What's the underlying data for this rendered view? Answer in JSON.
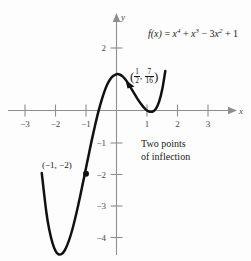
{
  "figure": {
    "type": "math-graph",
    "background": "#fdfdfd",
    "curve_color": "#111111",
    "axis_color": "#8e8e8e"
  },
  "labels": {
    "function_prefix": "f(x) = x",
    "function_exp1": "4",
    "function_mid1": " + x",
    "function_exp2": "3",
    "function_mid2": " − 3x",
    "function_exp3": "2",
    "function_tail": " + 1",
    "function_plain": "f(x) = x⁴ + x³ − 3x² + 1",
    "inflection_note_line1": "Two points",
    "inflection_note_line2": "of inflection",
    "minimum_point": "(−1, −2)",
    "inflection_point_plain": "(1/2, 7/16)",
    "inflection_num_x": "1",
    "inflection_den_x": "2",
    "inflection_num_y": "7",
    "inflection_den_y": "16",
    "x_axis_name": "x",
    "y_axis_name": "y"
  },
  "chart_data": {
    "type": "line",
    "xlabel": "x",
    "ylabel": "y",
    "xlim": [
      -3.6,
      3.6
    ],
    "ylim": [
      -4.7,
      2.6
    ],
    "grid": false,
    "legend": null,
    "x_ticks": [
      -3,
      -2,
      -1,
      1,
      2,
      3
    ],
    "x_tick_labels": [
      "−3",
      "−2",
      "−1",
      "1",
      "2",
      "3"
    ],
    "y_ticks": [
      2,
      -1,
      -2,
      -3,
      -4
    ],
    "y_tick_labels": [
      "2",
      "−1",
      "−2",
      "−3",
      "−4"
    ],
    "series": [
      {
        "name": "f(x) = x^4 + x^3 - 3x^2 + 1",
        "x": [
          -2.45,
          -2.3,
          -2.2,
          -2.1,
          -2.0,
          -1.9,
          -1.8,
          -1.7,
          -1.6,
          -1.5,
          -1.4,
          -1.3,
          -1.2,
          -1.1,
          -1.0,
          -0.9,
          -0.8,
          -0.7,
          -0.6,
          -0.5,
          -0.4,
          -0.3,
          -0.2,
          -0.1,
          0.0,
          0.1,
          0.2,
          0.3,
          0.4,
          0.5,
          0.6,
          0.7,
          0.8,
          0.9,
          1.0,
          1.1,
          1.2,
          1.3,
          1.4,
          1.5,
          1.6
        ],
        "y": [
          -1.98,
          -3.22,
          -3.79,
          -4.19,
          -4.44,
          -4.55,
          -4.54,
          -4.43,
          -4.22,
          -3.94,
          -3.59,
          -3.19,
          -2.75,
          -2.29,
          -1.82,
          -1.35,
          -0.89,
          -0.46,
          -0.06,
          0.29,
          0.59,
          0.83,
          1.0,
          1.1,
          1.15,
          1.14,
          1.08,
          0.97,
          0.83,
          0.67,
          0.51,
          0.35,
          0.21,
          0.09,
          0.0,
          -0.04,
          -0.03,
          0.07,
          0.29,
          0.67,
          1.25
        ],
        "points": [
          {
            "label": "(−1, −2)",
            "x": -1.0,
            "y": -2.0,
            "marker": "dot",
            "note": "point of inflection"
          },
          {
            "label": "(1/2, 7/16)",
            "x": 0.5,
            "y": 0.4375,
            "marker": "arrow",
            "note": "point of inflection"
          }
        ]
      }
    ],
    "annotations": [
      {
        "text": "Two points of inflection",
        "x": 0.85,
        "y": -1.1
      },
      {
        "text": "f(x) = x⁴ + x³ − 3x² + 1",
        "x": 1.2,
        "y": 2.4
      }
    ]
  }
}
